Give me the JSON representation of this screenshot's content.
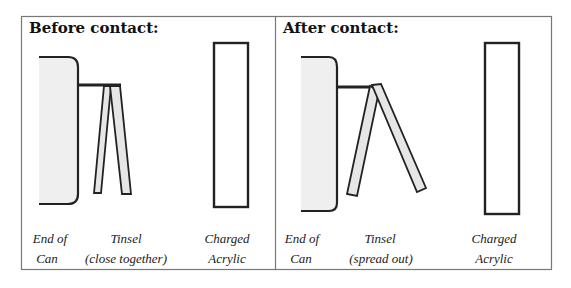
{
  "panels": [
    {
      "id": "before",
      "title": "Before contact:",
      "labels": {
        "can": [
          "End of",
          "Can"
        ],
        "tinsel": [
          "Tinsel",
          "(close together)"
        ],
        "acrylic": [
          "Charged",
          "Acrylic"
        ]
      }
    },
    {
      "id": "after",
      "title": "After contact:",
      "labels": {
        "can": [
          "End of",
          "Can"
        ],
        "tinsel": [
          "Tinsel",
          "(spread out)"
        ],
        "acrylic": [
          "Charged",
          "Acrylic"
        ]
      }
    }
  ],
  "colors": {
    "frame": "#777777",
    "stroke": "#222222",
    "can_fill": "#efefef",
    "tinsel_fill": "#e6e6e6",
    "background": "#ffffff"
  }
}
